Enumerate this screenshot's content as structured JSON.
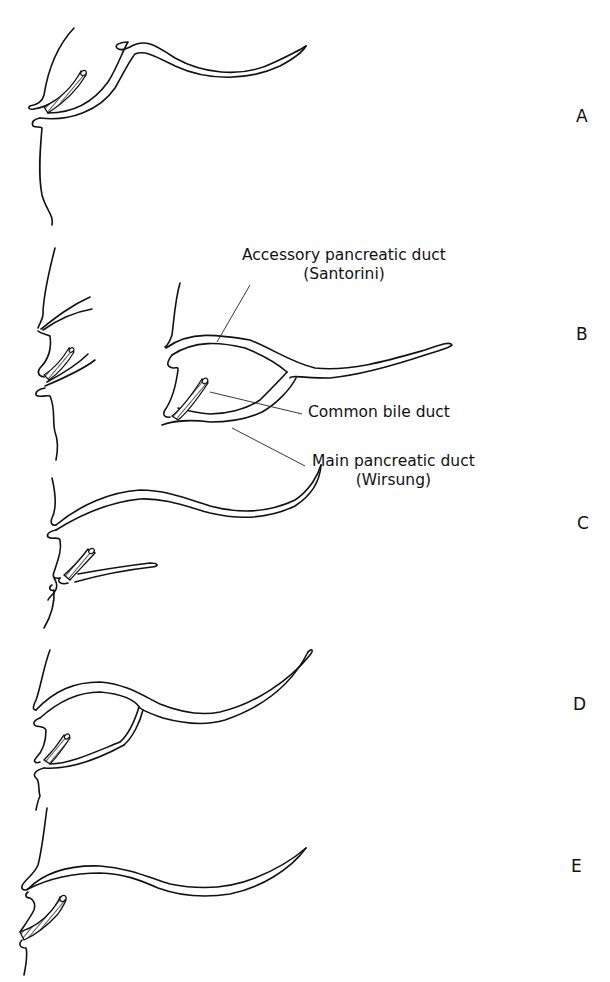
{
  "figure": {
    "panels": [
      {
        "id": "A",
        "label": "A"
      },
      {
        "id": "B",
        "label": "B"
      },
      {
        "id": "C",
        "label": "C"
      },
      {
        "id": "D",
        "label": "D"
      },
      {
        "id": "E",
        "label": "E"
      }
    ],
    "callouts": {
      "accessory_duct": {
        "line1": "Accessory pancreatic duct",
        "line2": "(Santorini)"
      },
      "common_bile_duct": {
        "line1": "Common bile duct"
      },
      "main_duct": {
        "line1": "Main pancreatic duct",
        "line2": "(Wirsung)"
      }
    },
    "colors": {
      "ink": "#111111",
      "background": "#ffffff"
    }
  }
}
